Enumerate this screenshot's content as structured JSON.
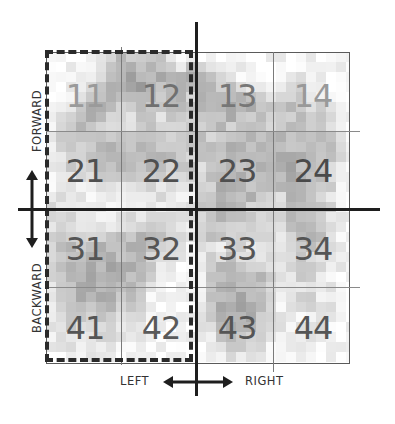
{
  "diagram": {
    "grid": {
      "rows": 4,
      "cols": 4,
      "cells": [
        [
          {
            "label": "11",
            "color": "#9a9a9a"
          },
          {
            "label": "12",
            "color": "#707070"
          },
          {
            "label": "13",
            "color": "#777777"
          },
          {
            "label": "14",
            "color": "#999999"
          }
        ],
        [
          {
            "label": "21",
            "color": "#4f4f4f"
          },
          {
            "label": "22",
            "color": "#4f4f4f"
          },
          {
            "label": "23",
            "color": "#4f4f4f"
          },
          {
            "label": "24",
            "color": "#4a4a4a"
          }
        ],
        [
          {
            "label": "31",
            "color": "#555555"
          },
          {
            "label": "32",
            "color": "#555555"
          },
          {
            "label": "33",
            "color": "#555555"
          },
          {
            "label": "34",
            "color": "#555555"
          }
        ],
        [
          {
            "label": "41",
            "color": "#555555"
          },
          {
            "label": "42",
            "color": "#5a5a5a"
          },
          {
            "label": "43",
            "color": "#555555"
          },
          {
            "label": "44",
            "color": "#555555"
          }
        ]
      ]
    },
    "highlight": {
      "description": "dashed outline around left two columns",
      "columns": [
        1,
        2
      ]
    },
    "axes": {
      "vertical_labels": {
        "top": "FORWARD",
        "bottom": "BACKWARD"
      },
      "horizontal_labels": {
        "left": "LEFT",
        "right": "RIGHT"
      }
    },
    "texture_seed": 7,
    "texture_intensity": [
      [
        0.05,
        0.05,
        0.05,
        0.05,
        0.1,
        0.15,
        0.3,
        0.35,
        0.25,
        0.3,
        0.35,
        0.3,
        0.1,
        0.1,
        0.1,
        0.05,
        0.05,
        0.05,
        0.05,
        0.05,
        0.05,
        0.05,
        0.05,
        0.05,
        0.05,
        0.05,
        0.05,
        0.05,
        0.05,
        0.05,
        0.05
      ],
      [
        0.05,
        0.05,
        0.05,
        0.05,
        0.1,
        0.15,
        0.35,
        0.45,
        0.4,
        0.35,
        0.45,
        0.4,
        0.2,
        0.15,
        0.3,
        0.25,
        0.2,
        0.1,
        0.1,
        0.1,
        0.05,
        0.05,
        0.05,
        0.05,
        0.05,
        0.1,
        0.1,
        0.05,
        0.05,
        0.05,
        0.05
      ],
      [
        0.05,
        0.05,
        0.05,
        0.05,
        0.1,
        0.2,
        0.4,
        0.45,
        0.5,
        0.45,
        0.4,
        0.45,
        0.35,
        0.35,
        0.4,
        0.35,
        0.3,
        0.2,
        0.15,
        0.1,
        0.1,
        0.05,
        0.05,
        0.05,
        0.1,
        0.15,
        0.1,
        0.05,
        0.05,
        0.05,
        0.05
      ],
      [
        0.05,
        0.05,
        0.05,
        0.1,
        0.15,
        0.3,
        0.45,
        0.5,
        0.45,
        0.5,
        0.45,
        0.4,
        0.45,
        0.4,
        0.35,
        0.4,
        0.35,
        0.3,
        0.3,
        0.25,
        0.2,
        0.2,
        0.15,
        0.1,
        0.15,
        0.2,
        0.15,
        0.1,
        0.05,
        0.05,
        0.05
      ],
      [
        0.05,
        0.05,
        0.1,
        0.2,
        0.25,
        0.4,
        0.5,
        0.45,
        0.35,
        0.45,
        0.4,
        0.35,
        0.4,
        0.45,
        0.3,
        0.4,
        0.4,
        0.35,
        0.4,
        0.35,
        0.3,
        0.25,
        0.2,
        0.25,
        0.3,
        0.25,
        0.2,
        0.15,
        0.1,
        0.05,
        0.05
      ],
      [
        0.05,
        0.1,
        0.15,
        0.3,
        0.4,
        0.45,
        0.4,
        0.3,
        0.2,
        0.35,
        0.3,
        0.25,
        0.35,
        0.4,
        0.25,
        0.35,
        0.4,
        0.4,
        0.45,
        0.35,
        0.4,
        0.3,
        0.25,
        0.3,
        0.35,
        0.3,
        0.25,
        0.2,
        0.15,
        0.05,
        0.05
      ],
      [
        0.05,
        0.15,
        0.25,
        0.35,
        0.4,
        0.35,
        0.3,
        0.25,
        0.15,
        0.25,
        0.3,
        0.2,
        0.3,
        0.35,
        0.3,
        0.3,
        0.35,
        0.4,
        0.4,
        0.3,
        0.35,
        0.4,
        0.3,
        0.25,
        0.3,
        0.35,
        0.3,
        0.25,
        0.2,
        0.1,
        0.05
      ],
      [
        0.1,
        0.25,
        0.3,
        0.35,
        0.3,
        0.3,
        0.25,
        0.2,
        0.2,
        0.3,
        0.35,
        0.25,
        0.3,
        0.3,
        0.25,
        0.25,
        0.3,
        0.35,
        0.3,
        0.35,
        0.4,
        0.35,
        0.3,
        0.35,
        0.35,
        0.3,
        0.35,
        0.3,
        0.2,
        0.1,
        0.05
      ],
      [
        0.1,
        0.3,
        0.35,
        0.3,
        0.25,
        0.25,
        0.3,
        0.25,
        0.25,
        0.35,
        0.4,
        0.35,
        0.3,
        0.25,
        0.3,
        0.3,
        0.25,
        0.3,
        0.35,
        0.4,
        0.35,
        0.3,
        0.35,
        0.4,
        0.35,
        0.35,
        0.4,
        0.35,
        0.25,
        0.15,
        0.05
      ],
      [
        0.1,
        0.25,
        0.3,
        0.3,
        0.3,
        0.35,
        0.4,
        0.35,
        0.3,
        0.4,
        0.4,
        0.35,
        0.35,
        0.3,
        0.25,
        0.3,
        0.3,
        0.35,
        0.4,
        0.45,
        0.4,
        0.35,
        0.4,
        0.4,
        0.35,
        0.4,
        0.4,
        0.35,
        0.3,
        0.15,
        0.05
      ],
      [
        0.1,
        0.2,
        0.25,
        0.3,
        0.35,
        0.4,
        0.45,
        0.4,
        0.35,
        0.4,
        0.4,
        0.4,
        0.4,
        0.35,
        0.3,
        0.35,
        0.35,
        0.4,
        0.4,
        0.45,
        0.45,
        0.4,
        0.4,
        0.45,
        0.4,
        0.4,
        0.45,
        0.4,
        0.3,
        0.15,
        0.05
      ],
      [
        0.1,
        0.15,
        0.25,
        0.3,
        0.3,
        0.35,
        0.4,
        0.4,
        0.4,
        0.35,
        0.35,
        0.35,
        0.3,
        0.3,
        0.3,
        0.25,
        0.35,
        0.4,
        0.45,
        0.4,
        0.4,
        0.45,
        0.4,
        0.45,
        0.45,
        0.4,
        0.4,
        0.4,
        0.25,
        0.15,
        0.05
      ],
      [
        0.1,
        0.15,
        0.2,
        0.25,
        0.2,
        0.25,
        0.3,
        0.3,
        0.25,
        0.25,
        0.3,
        0.25,
        0.2,
        0.25,
        0.2,
        0.25,
        0.35,
        0.4,
        0.4,
        0.4,
        0.4,
        0.35,
        0.4,
        0.4,
        0.45,
        0.4,
        0.4,
        0.35,
        0.25,
        0.1,
        0.05
      ],
      [
        0.1,
        0.15,
        0.2,
        0.15,
        0.1,
        0.15,
        0.2,
        0.2,
        0.15,
        0.2,
        0.25,
        0.2,
        0.15,
        0.15,
        0.1,
        0.2,
        0.3,
        0.4,
        0.4,
        0.35,
        0.35,
        0.4,
        0.4,
        0.35,
        0.4,
        0.35,
        0.35,
        0.3,
        0.25,
        0.1,
        0.05
      ],
      [
        0.1,
        0.2,
        0.15,
        0.15,
        0.1,
        0.1,
        0.15,
        0.15,
        0.1,
        0.15,
        0.2,
        0.15,
        0.1,
        0.1,
        0.1,
        0.2,
        0.35,
        0.4,
        0.35,
        0.35,
        0.4,
        0.35,
        0.3,
        0.25,
        0.4,
        0.35,
        0.3,
        0.3,
        0.2,
        0.1,
        0.05
      ],
      [
        0.15,
        0.2,
        0.2,
        0.15,
        0.1,
        0.1,
        0.1,
        0.1,
        0.1,
        0.15,
        0.15,
        0.15,
        0.1,
        0.1,
        0.15,
        0.25,
        0.35,
        0.4,
        0.4,
        0.35,
        0.3,
        0.3,
        0.25,
        0.2,
        0.35,
        0.35,
        0.3,
        0.25,
        0.2,
        0.1,
        0.05
      ],
      [
        0.2,
        0.25,
        0.2,
        0.15,
        0.15,
        0.1,
        0.1,
        0.1,
        0.15,
        0.2,
        0.25,
        0.25,
        0.15,
        0.1,
        0.15,
        0.25,
        0.35,
        0.4,
        0.35,
        0.3,
        0.3,
        0.25,
        0.2,
        0.2,
        0.35,
        0.3,
        0.3,
        0.25,
        0.2,
        0.1,
        0.05
      ],
      [
        0.2,
        0.25,
        0.2,
        0.15,
        0.2,
        0.2,
        0.15,
        0.2,
        0.25,
        0.3,
        0.35,
        0.3,
        0.2,
        0.15,
        0.15,
        0.2,
        0.35,
        0.35,
        0.3,
        0.3,
        0.25,
        0.25,
        0.2,
        0.25,
        0.35,
        0.35,
        0.3,
        0.3,
        0.2,
        0.1,
        0.05
      ],
      [
        0.2,
        0.3,
        0.3,
        0.25,
        0.3,
        0.3,
        0.3,
        0.35,
        0.35,
        0.4,
        0.35,
        0.3,
        0.25,
        0.2,
        0.15,
        0.2,
        0.3,
        0.3,
        0.25,
        0.2,
        0.2,
        0.2,
        0.15,
        0.2,
        0.3,
        0.35,
        0.35,
        0.3,
        0.2,
        0.1,
        0.05
      ],
      [
        0.25,
        0.35,
        0.35,
        0.35,
        0.4,
        0.4,
        0.4,
        0.4,
        0.4,
        0.4,
        0.3,
        0.25,
        0.2,
        0.15,
        0.1,
        0.15,
        0.2,
        0.15,
        0.2,
        0.25,
        0.2,
        0.2,
        0.15,
        0.2,
        0.25,
        0.3,
        0.3,
        0.25,
        0.2,
        0.1,
        0.05
      ],
      [
        0.25,
        0.35,
        0.4,
        0.4,
        0.45,
        0.45,
        0.45,
        0.4,
        0.4,
        0.35,
        0.25,
        0.2,
        0.15,
        0.1,
        0.1,
        0.15,
        0.2,
        0.25,
        0.3,
        0.25,
        0.2,
        0.2,
        0.2,
        0.15,
        0.2,
        0.25,
        0.25,
        0.2,
        0.15,
        0.1,
        0.05
      ],
      [
        0.2,
        0.3,
        0.4,
        0.45,
        0.45,
        0.4,
        0.45,
        0.45,
        0.4,
        0.35,
        0.25,
        0.15,
        0.1,
        0.05,
        0.05,
        0.1,
        0.3,
        0.35,
        0.4,
        0.35,
        0.3,
        0.3,
        0.2,
        0.1,
        0.2,
        0.25,
        0.25,
        0.2,
        0.15,
        0.1,
        0.05
      ],
      [
        0.2,
        0.3,
        0.4,
        0.45,
        0.45,
        0.45,
        0.4,
        0.45,
        0.4,
        0.35,
        0.2,
        0.1,
        0.05,
        0.05,
        0.05,
        0.1,
        0.35,
        0.4,
        0.4,
        0.4,
        0.35,
        0.35,
        0.25,
        0.1,
        0.2,
        0.25,
        0.2,
        0.15,
        0.1,
        0.05,
        0.05
      ],
      [
        0.2,
        0.3,
        0.35,
        0.4,
        0.45,
        0.45,
        0.45,
        0.4,
        0.4,
        0.3,
        0.15,
        0.1,
        0.05,
        0.05,
        0.05,
        0.1,
        0.3,
        0.4,
        0.45,
        0.4,
        0.4,
        0.35,
        0.25,
        0.1,
        0.2,
        0.2,
        0.2,
        0.15,
        0.1,
        0.05,
        0.05
      ],
      [
        0.15,
        0.25,
        0.35,
        0.4,
        0.4,
        0.4,
        0.4,
        0.35,
        0.35,
        0.25,
        0.1,
        0.05,
        0.05,
        0.05,
        0.05,
        0.1,
        0.35,
        0.4,
        0.45,
        0.45,
        0.4,
        0.4,
        0.3,
        0.1,
        0.15,
        0.2,
        0.2,
        0.15,
        0.1,
        0.05,
        0.05
      ],
      [
        0.15,
        0.25,
        0.3,
        0.35,
        0.35,
        0.35,
        0.35,
        0.3,
        0.3,
        0.2,
        0.1,
        0.05,
        0.05,
        0.05,
        0.05,
        0.1,
        0.35,
        0.45,
        0.45,
        0.45,
        0.4,
        0.4,
        0.3,
        0.1,
        0.1,
        0.15,
        0.2,
        0.2,
        0.15,
        0.05,
        0.05
      ],
      [
        0.15,
        0.2,
        0.25,
        0.3,
        0.3,
        0.3,
        0.3,
        0.25,
        0.25,
        0.15,
        0.05,
        0.05,
        0.05,
        0.05,
        0.05,
        0.1,
        0.25,
        0.4,
        0.45,
        0.4,
        0.4,
        0.35,
        0.25,
        0.1,
        0.1,
        0.1,
        0.15,
        0.15,
        0.1,
        0.05,
        0.05
      ],
      [
        0.1,
        0.2,
        0.25,
        0.25,
        0.25,
        0.25,
        0.25,
        0.2,
        0.2,
        0.1,
        0.05,
        0.05,
        0.05,
        0.05,
        0.05,
        0.1,
        0.2,
        0.35,
        0.4,
        0.4,
        0.35,
        0.3,
        0.2,
        0.1,
        0.05,
        0.1,
        0.15,
        0.15,
        0.1,
        0.05,
        0.05
      ],
      [
        0.1,
        0.15,
        0.2,
        0.2,
        0.2,
        0.2,
        0.2,
        0.15,
        0.15,
        0.1,
        0.05,
        0.05,
        0.05,
        0.05,
        0.05,
        0.05,
        0.15,
        0.3,
        0.35,
        0.35,
        0.3,
        0.25,
        0.15,
        0.05,
        0.05,
        0.1,
        0.2,
        0.2,
        0.1,
        0.05,
        0.05
      ],
      [
        0.1,
        0.1,
        0.15,
        0.15,
        0.15,
        0.15,
        0.15,
        0.1,
        0.1,
        0.05,
        0.05,
        0.05,
        0.05,
        0.05,
        0.05,
        0.05,
        0.1,
        0.2,
        0.25,
        0.25,
        0.2,
        0.15,
        0.1,
        0.05,
        0.05,
        0.05,
        0.1,
        0.1,
        0.05,
        0.05,
        0.05
      ],
      [
        0.05,
        0.05,
        0.1,
        0.1,
        0.1,
        0.1,
        0.1,
        0.05,
        0.05,
        0.05,
        0.05,
        0.05,
        0.05,
        0.05,
        0.05,
        0.05,
        0.05,
        0.1,
        0.15,
        0.15,
        0.1,
        0.1,
        0.05,
        0.05,
        0.05,
        0.05,
        0.05,
        0.05,
        0.05,
        0.05,
        0.05
      ]
    ]
  }
}
